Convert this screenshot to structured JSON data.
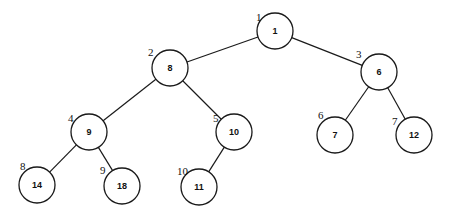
{
  "diagram": {
    "type": "binary-tree",
    "node_radius": 18,
    "colors": {
      "stroke": "#1a1a1a",
      "fill": "#ffffff",
      "text": "#111111"
    },
    "nodes": [
      {
        "id": "n1",
        "index": "1",
        "value": "1",
        "cx": 275,
        "cy": 31,
        "ix": 256,
        "iy": 21
      },
      {
        "id": "n2",
        "index": "2",
        "value": "8",
        "cx": 170,
        "cy": 68,
        "ix": 148,
        "iy": 56
      },
      {
        "id": "n3",
        "index": "3",
        "value": "6",
        "cx": 379,
        "cy": 72,
        "ix": 356,
        "iy": 58
      },
      {
        "id": "n4",
        "index": "4",
        "value": "9",
        "cx": 89,
        "cy": 132,
        "ix": 68,
        "iy": 122
      },
      {
        "id": "n5",
        "index": "5",
        "value": "10",
        "cx": 234,
        "cy": 132,
        "ix": 213,
        "iy": 122
      },
      {
        "id": "n6",
        "index": "6",
        "value": "7",
        "cx": 335,
        "cy": 135,
        "ix": 318,
        "iy": 119
      },
      {
        "id": "n7",
        "index": "7",
        "value": "12",
        "cx": 414,
        "cy": 135,
        "ix": 392,
        "iy": 125
      },
      {
        "id": "n8",
        "index": "8",
        "value": "14",
        "cx": 37,
        "cy": 185,
        "ix": 20,
        "iy": 170
      },
      {
        "id": "n9",
        "index": "9",
        "value": "18",
        "cx": 122,
        "cy": 186,
        "ix": 100,
        "iy": 174
      },
      {
        "id": "n10",
        "index": "10",
        "value": "11",
        "cx": 199,
        "cy": 187,
        "ix": 177,
        "iy": 175
      }
    ],
    "edges": [
      {
        "from": "n1",
        "to": "n2"
      },
      {
        "from": "n1",
        "to": "n3"
      },
      {
        "from": "n2",
        "to": "n4"
      },
      {
        "from": "n2",
        "to": "n5"
      },
      {
        "from": "n3",
        "to": "n6"
      },
      {
        "from": "n3",
        "to": "n7"
      },
      {
        "from": "n4",
        "to": "n8"
      },
      {
        "from": "n4",
        "to": "n9"
      },
      {
        "from": "n5",
        "to": "n10"
      }
    ]
  }
}
